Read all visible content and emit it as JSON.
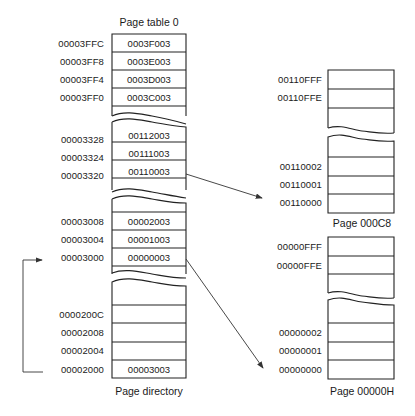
{
  "page_table": {
    "title": "Page table 0",
    "top_rows": [
      {
        "addr": "00003FFC",
        "value": "0003F003"
      },
      {
        "addr": "00003FF8",
        "value": "0003E003"
      },
      {
        "addr": "00003FF4",
        "value": "0003D003"
      },
      {
        "addr": "00003FF0",
        "value": "0003C003"
      }
    ],
    "mid_rows": [
      {
        "addr": "00003328",
        "value": "00112003"
      },
      {
        "addr": "00003324",
        "value": "00111003"
      },
      {
        "addr": "00003320",
        "value": "00110003"
      }
    ],
    "low_rows": [
      {
        "addr": "00003008",
        "value": "00002003"
      },
      {
        "addr": "00003004",
        "value": "00001003"
      },
      {
        "addr": "00003000",
        "value": "00000003"
      }
    ]
  },
  "page_directory": {
    "title": "Page directory",
    "rows": [
      {
        "addr": "0000200C",
        "value": ""
      },
      {
        "addr": "00002008",
        "value": ""
      },
      {
        "addr": "00002004",
        "value": ""
      },
      {
        "addr": "00002000",
        "value": "00003003"
      }
    ]
  },
  "page_c8": {
    "title": "Page 000C8",
    "top_addrs": [
      "00110FFF",
      "00110FFE"
    ],
    "bottom_addrs": [
      "00110002",
      "00110001",
      "00110000"
    ]
  },
  "page_0": {
    "title": "Page 00000H",
    "top_addrs": [
      "00000FFF",
      "00000FFE"
    ],
    "bottom_addrs": [
      "00000002",
      "00000001",
      "00000000"
    ]
  },
  "arrows": [
    {
      "from": "00003320",
      "to": "00110000"
    },
    {
      "from": "00003000",
      "to": "00000000"
    },
    {
      "from": "00002000",
      "to": "00003000"
    }
  ]
}
